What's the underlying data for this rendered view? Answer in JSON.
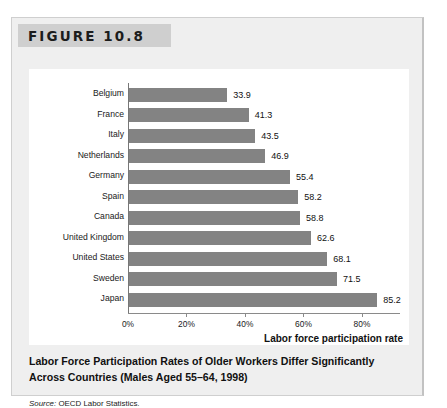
{
  "figure": {
    "header_label": "FIGURE 10.8",
    "caption_line1": "Labor Force Participation Rates of Older Workers Differ Significantly",
    "caption_line2": "Across Countries (Males Aged 55–64, 1998)",
    "source_prefix": "Source:",
    "source_text": "OECD Labor Statistics.",
    "bar_color": "#838383",
    "panel_color": "#efefef",
    "header_band_color": "#cfcfcf"
  },
  "chart_data": {
    "type": "bar",
    "orientation": "horizontal",
    "title": "Labor Force Participation Rates of Older Workers Differ Significantly Across Countries (Males Aged 55–64, 1998)",
    "xlabel": "Labor force participation rate",
    "ylabel": "",
    "categories": [
      "Belgium",
      "France",
      "Italy",
      "Netherlands",
      "Germany",
      "Spain",
      "Canada",
      "United Kingdom",
      "United States",
      "Sweden",
      "Japan"
    ],
    "values": [
      33.9,
      41.3,
      43.5,
      46.9,
      55.4,
      58.2,
      58.8,
      62.6,
      68.1,
      71.5,
      85.2
    ],
    "value_labels": [
      "33.9",
      "41.3",
      "43.5",
      "46.9",
      "55.4",
      "58.2",
      "58.8",
      "62.6",
      "68.1",
      "71.5",
      "85.2"
    ],
    "xlim": [
      0,
      93
    ],
    "xticks": [
      0,
      20,
      40,
      60,
      80
    ],
    "xtick_labels": [
      "0%",
      "20%",
      "40%",
      "60%",
      "80%"
    ],
    "grid": false,
    "legend": false
  }
}
